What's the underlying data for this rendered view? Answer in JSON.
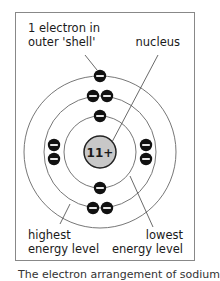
{
  "diagram": {
    "nucleus": {
      "label": "11+",
      "fill": "#c8c8c8"
    },
    "labels": {
      "outer_electron_line1": "1 electron in",
      "outer_electron_line2": "outer 'shell'",
      "nucleus": "nucleus",
      "highest_line1": "highest",
      "highest_line2": "energy level",
      "lowest_line1": "lowest",
      "lowest_line2": "energy level"
    },
    "shells": [
      {
        "name": "inner",
        "radius": 36,
        "electrons": 2
      },
      {
        "name": "middle",
        "radius": 56,
        "electrons": 8
      },
      {
        "name": "outer",
        "radius": 76,
        "electrons": 1
      }
    ],
    "electron_symbol": "−",
    "colors": {
      "electron": "#111111",
      "ring": "#777777",
      "frame": "#888888",
      "text": "#1a1a1a"
    }
  },
  "caption": "The electron arrangement of sodium"
}
